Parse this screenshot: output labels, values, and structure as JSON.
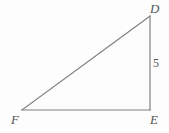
{
  "figure": {
    "name": "right-triangle-DEF",
    "background_color": "#fdfdfd",
    "stroke_color": "#808080",
    "text_color": "#555555",
    "stroke_width": 1.2,
    "vertices": [
      {
        "id": "D",
        "label": "D",
        "x": 150,
        "y": 16,
        "label_x": 150,
        "label_y": 2
      },
      {
        "id": "E",
        "label": "E",
        "x": 150,
        "y": 110,
        "label_x": 150,
        "label_y": 113
      },
      {
        "id": "F",
        "label": "F",
        "x": 22,
        "y": 110,
        "label_x": 11,
        "label_y": 113
      }
    ],
    "edges": [
      {
        "id": "DE",
        "from": "D",
        "to": "E",
        "x1": 150,
        "y1": 16,
        "x2": 150,
        "y2": 110,
        "measure_label": "5"
      },
      {
        "id": "EF",
        "from": "E",
        "to": "F",
        "x1": 150,
        "y1": 110,
        "x2": 22,
        "y2": 110,
        "measure_label": ""
      },
      {
        "id": "FD",
        "from": "F",
        "to": "D",
        "x1": 22,
        "y1": 110,
        "x2": 150,
        "y2": 16,
        "measure_label": ""
      }
    ],
    "measures": [
      {
        "id": "side-DE",
        "value": "5",
        "x": 153,
        "y": 57
      }
    ]
  }
}
